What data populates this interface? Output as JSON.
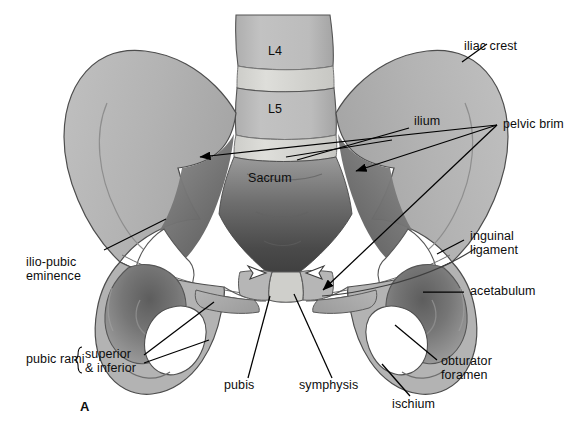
{
  "figure": {
    "panel_letter": "A",
    "view": "anterior",
    "background_color": "#ffffff",
    "palette": {
      "bone_light": "#b9b9b9",
      "bone_mid": "#a9a9a9",
      "bone_dark": "#8d8d8d",
      "cavity_dark": "#4f4f4f",
      "cavity_darkest": "#3a3a3a",
      "disc": "#d6d6d2",
      "foramen_white": "#ffffff",
      "outline": "#3b3b3b",
      "leader_line": "#000000",
      "text": "#0d0d0d"
    }
  },
  "structures": {
    "vertebrae": [
      {
        "name": "L4",
        "label": "L4"
      },
      {
        "name": "L5",
        "label": "L5"
      }
    ],
    "sacrum_label": "Sacrum"
  },
  "labels": [
    {
      "id": "iliac-crest",
      "text": "iliac crest",
      "lines": [
        "iliac crest"
      ],
      "side": "right",
      "leader": "line"
    },
    {
      "id": "pelvic-brim",
      "text": "pelvic brim",
      "lines": [
        "pelvic brim"
      ],
      "side": "right",
      "leader": "triple-arrow"
    },
    {
      "id": "ilium",
      "text": "ilium",
      "lines": [
        "ilium"
      ],
      "side": "inner",
      "leader": "none"
    },
    {
      "id": "inguinal-ligament",
      "text": "inguinal ligament",
      "lines": [
        "inguinal",
        "ligament"
      ],
      "side": "right",
      "leader": "line"
    },
    {
      "id": "acetabulum",
      "text": "acetabulum",
      "lines": [
        "acetabulum"
      ],
      "side": "right",
      "leader": "line"
    },
    {
      "id": "obturator-foramen",
      "text": "obturator foramen",
      "lines": [
        "obturator",
        "foramen"
      ],
      "side": "right",
      "leader": "line"
    },
    {
      "id": "ischium",
      "text": "ischium",
      "lines": [
        "ischium"
      ],
      "side": "bottom",
      "leader": "line"
    },
    {
      "id": "symphysis",
      "text": "symphysis",
      "lines": [
        "symphysis"
      ],
      "side": "bottom",
      "leader": "line"
    },
    {
      "id": "pubis",
      "text": "pubis",
      "lines": [
        "pubis"
      ],
      "side": "bottom",
      "leader": "line"
    },
    {
      "id": "pubic-rami",
      "text": "pubic rami",
      "lines": [
        "pubic rami"
      ],
      "side": "left",
      "leader": "brace"
    },
    {
      "id": "pubic-rami-sub",
      "text": "superior & inferior",
      "lines": [
        "superior",
        "& inferior"
      ],
      "side": "left",
      "leader": "two-lines"
    },
    {
      "id": "ilio-pubic-eminence",
      "text": "ilio-pubic eminence",
      "lines": [
        "ilio-pubic",
        "eminence"
      ],
      "side": "left",
      "leader": "line"
    },
    {
      "id": "sacrum",
      "text": "Sacrum",
      "lines": [
        "Sacrum"
      ],
      "side": "inner",
      "leader": "none"
    },
    {
      "id": "l4",
      "text": "L4",
      "lines": [
        "L4"
      ],
      "side": "inner",
      "leader": "none"
    },
    {
      "id": "l5",
      "text": "L5",
      "lines": [
        "L5"
      ],
      "side": "inner",
      "leader": "none"
    }
  ]
}
